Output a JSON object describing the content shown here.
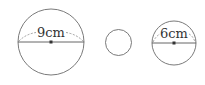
{
  "diagram": {
    "type": "circles-comparison",
    "colors": {
      "stroke": "#6b6b6b",
      "text": "#333333",
      "center": "#333333"
    },
    "circles": [
      {
        "id": "large",
        "cx": 51,
        "cy": 42,
        "r": 33,
        "diameter_label": "9cm",
        "has_diameter": true
      },
      {
        "id": "small",
        "cx": 118.5,
        "cy": 42.5,
        "r": 13,
        "diameter_label": "",
        "has_diameter": false
      },
      {
        "id": "medium",
        "cx": 174,
        "cy": 43,
        "r": 22,
        "diameter_label": "6cm",
        "has_diameter": true
      }
    ]
  }
}
